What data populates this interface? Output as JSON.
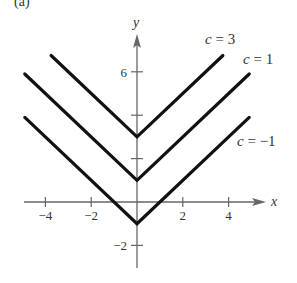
{
  "figure": {
    "part_label": "(a)"
  },
  "chart_data": {
    "type": "line",
    "title": "",
    "xlabel": "x",
    "ylabel": "y",
    "xlim": [
      -4.8,
      5.6
    ],
    "ylim": [
      -3,
      8
    ],
    "x_ticks": [
      -4,
      -2,
      2,
      4
    ],
    "x_tick_labels": [
      "−4",
      "−2",
      "2",
      "4"
    ],
    "y_ticks": [
      -2,
      2,
      4,
      6
    ],
    "y_tick_labels": [
      "−2",
      "",
      "",
      "6"
    ],
    "grid": false,
    "series": [
      {
        "name": "c = 3",
        "function": "y = |x| + 3",
        "x": [
          -3.75,
          0,
          3.75
        ],
        "y": [
          6.75,
          3,
          6.75
        ]
      },
      {
        "name": "c = 1",
        "function": "y = |x| + 1",
        "x": [
          -4.9,
          0,
          4.9
        ],
        "y": [
          5.9,
          1,
          5.9
        ]
      },
      {
        "name": "c = −1",
        "function": "y = |x| − 1",
        "x": [
          -4.9,
          0,
          4.9
        ],
        "y": [
          3.9,
          -1,
          3.9
        ]
      }
    ],
    "annotations": [
      {
        "text": "c = 3",
        "near": "upper right end of c=3 curve"
      },
      {
        "text": "c = 1",
        "near": "upper right end of c=1 curve"
      },
      {
        "text": "c = −1",
        "near": "right of c=−1 curve"
      }
    ]
  },
  "colors": {
    "curve": "#111111",
    "axis": "#666666",
    "text": "#333333"
  }
}
